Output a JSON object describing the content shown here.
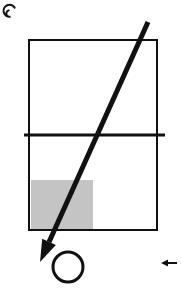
{
  "canvas": {
    "width": 181,
    "height": 302,
    "background": "#ffffff",
    "title": "hand-drawn geometric diagram"
  },
  "palette": {
    "stroke": "#111111",
    "shaded_fill": "#c4c4c4",
    "background": "#ffffff"
  },
  "shapes": {
    "corner_mark": {
      "name": "spiral-curl-mark",
      "x": 9,
      "y": 11,
      "radius": 6,
      "stroke_width": 2
    },
    "main_rectangle": {
      "name": "outer-rectangle",
      "x": 29,
      "y": 40,
      "width": 128,
      "height": 190,
      "stroke_width": 2,
      "fill": "none"
    },
    "horizontal_line": {
      "name": "horizontal-crossbar",
      "x1": 24,
      "y1": 135,
      "x2": 165,
      "y2": 135,
      "stroke_width": 3
    },
    "shaded_rectangle": {
      "name": "shaded-region",
      "x": 31,
      "y": 180,
      "width": 62,
      "height": 49,
      "fill": "#c4c4c4"
    },
    "diagonal_arrow": {
      "name": "diagonal-arrow",
      "x1": 148,
      "y1": 22,
      "x2": 40,
      "y2": 262,
      "stroke_width": 5,
      "head_length": 22,
      "head_width": 15
    },
    "circle": {
      "name": "circle-outline",
      "cx": 68,
      "cy": 267,
      "r": 15,
      "stroke_width": 3,
      "fill": "none"
    },
    "small_arrow": {
      "name": "small-left-arrow",
      "x1": 177,
      "y1": 263,
      "x2": 161,
      "y2": 263,
      "stroke_width": 2,
      "head_length": 7,
      "head_width": 7,
      "direction": "left"
    }
  },
  "labels": {
    "text_items": []
  }
}
